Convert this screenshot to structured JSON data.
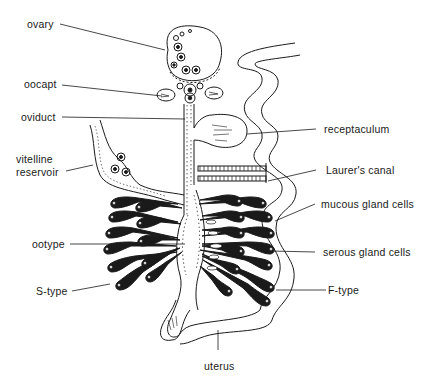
{
  "diagram": {
    "colors": {
      "ink": "#1a1a1a",
      "background": "#ffffff"
    },
    "labels": {
      "ovary": "ovary",
      "oocapt": "oocapt",
      "oviduct": "oviduct",
      "vitelline_1": "vitelline",
      "vitelline_2": "reservoir",
      "ootype": "ootype",
      "s_type": "S-type",
      "receptaculum": "receptaculum",
      "laurers_canal": "Laurer's canal",
      "mucous_gland_cells": "mucous gland cells",
      "serous_gland_cells": "serous gland cells",
      "f_type": "F-type",
      "uterus": "uterus"
    }
  }
}
